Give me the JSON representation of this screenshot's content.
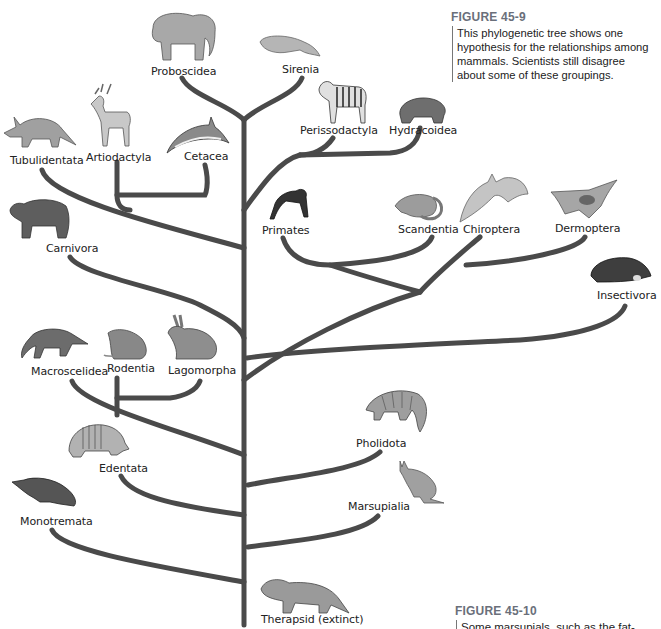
{
  "figure_main": {
    "heading": "FIGURE 45-9",
    "caption": "This phylogenetic tree shows one hypothesis for the relationships among mammals. Scientists still disagree about some of these groupings."
  },
  "figure_next": {
    "heading": "FIGURE 45-10",
    "caption_partial": "Some marsupials, such as the fat-tailed"
  },
  "tree": {
    "root": "Therapsid (extinct)",
    "taxa": [
      {
        "name": "Proboscidea",
        "animal": "elephant-icon"
      },
      {
        "name": "Sirenia",
        "animal": "manatee-icon"
      },
      {
        "name": "Perissodactyla",
        "animal": "zebra-icon"
      },
      {
        "name": "Hydracoidea",
        "animal": "hyrax-icon"
      },
      {
        "name": "Tubulidentata",
        "animal": "aardvark-icon"
      },
      {
        "name": "Artiodactyla",
        "animal": "deer-icon"
      },
      {
        "name": "Cetacea",
        "animal": "dolphin-icon"
      },
      {
        "name": "Carnivora",
        "animal": "bear-icon"
      },
      {
        "name": "Primates",
        "animal": "chimpanzee-icon"
      },
      {
        "name": "Scandentia",
        "animal": "tree-shrew-icon"
      },
      {
        "name": "Chiroptera",
        "animal": "bat-icon"
      },
      {
        "name": "Dermoptera",
        "animal": "flying-lemur-icon"
      },
      {
        "name": "Insectivora",
        "animal": "mole-icon"
      },
      {
        "name": "Macroscelidea",
        "animal": "elephant-shrew-icon"
      },
      {
        "name": "Rodentia",
        "animal": "mouse-icon"
      },
      {
        "name": "Lagomorpha",
        "animal": "rabbit-icon"
      },
      {
        "name": "Pholidota",
        "animal": "pangolin-icon"
      },
      {
        "name": "Edentata",
        "animal": "armadillo-icon"
      },
      {
        "name": "Marsupialia",
        "animal": "kangaroo-icon"
      },
      {
        "name": "Monotremata",
        "animal": "platypus-icon"
      }
    ]
  },
  "colors": {
    "branch": "#4a4a4a",
    "heading": "#6a6f7a",
    "animal_fill": "#9a9a9a"
  }
}
